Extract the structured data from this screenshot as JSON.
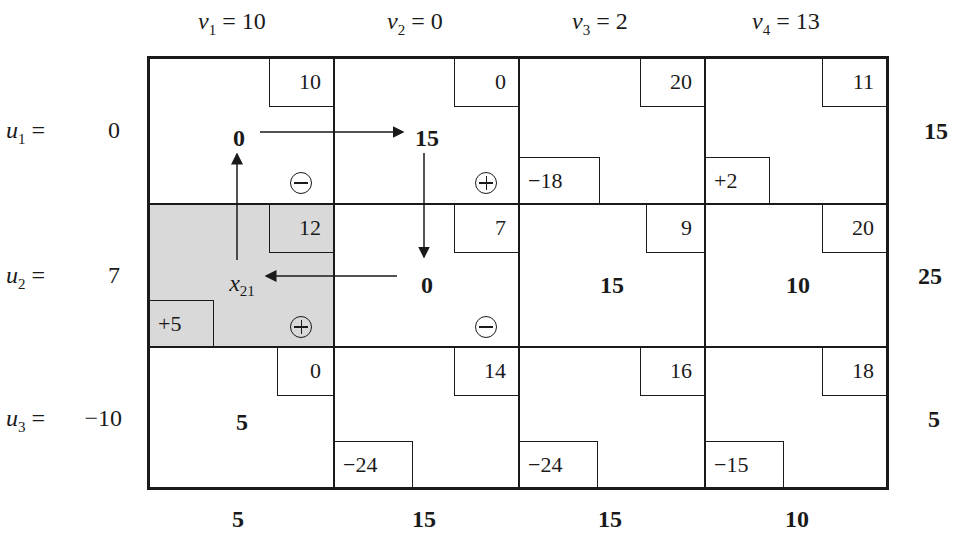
{
  "title_fragment": "TABLE 5-12",
  "column_potentials": [
    {
      "symbol": "v",
      "index": "1",
      "value": "10"
    },
    {
      "symbol": "v",
      "index": "2",
      "value": "0"
    },
    {
      "symbol": "v",
      "index": "3",
      "value": "2"
    },
    {
      "symbol": "v",
      "index": "4",
      "value": "13"
    }
  ],
  "row_potentials": [
    {
      "symbol": "u",
      "index": "1",
      "value": "0"
    },
    {
      "symbol": "u",
      "index": "2",
      "value": "7"
    },
    {
      "symbol": "u",
      "index": "3",
      "value": "−10"
    }
  ],
  "cells": [
    [
      {
        "cost": "10",
        "allocation": "0",
        "reduced": "",
        "sign": "minus"
      },
      {
        "cost": "0",
        "allocation": "15",
        "reduced": "",
        "sign": "plus"
      },
      {
        "cost": "20",
        "allocation": "",
        "reduced": "−18",
        "sign": ""
      },
      {
        "cost": "11",
        "allocation": "",
        "reduced": "+2",
        "sign": ""
      }
    ],
    [
      {
        "cost": "12",
        "allocation": "x",
        "allocation_sub": "21",
        "reduced": "+5",
        "sign": "plus",
        "shaded": true
      },
      {
        "cost": "7",
        "allocation": "0",
        "reduced": "",
        "sign": "minus"
      },
      {
        "cost": "9",
        "allocation": "15",
        "reduced": "",
        "sign": ""
      },
      {
        "cost": "20",
        "allocation": "10",
        "reduced": "",
        "sign": ""
      }
    ],
    [
      {
        "cost": "0",
        "allocation": "5",
        "reduced": "",
        "sign": ""
      },
      {
        "cost": "14",
        "allocation": "",
        "reduced": "−24",
        "sign": ""
      },
      {
        "cost": "16",
        "allocation": "",
        "reduced": "−24",
        "sign": ""
      },
      {
        "cost": "18",
        "allocation": "",
        "reduced": "−15",
        "sign": ""
      }
    ]
  ],
  "supply": [
    "15",
    "25",
    "5"
  ],
  "demand": [
    "5",
    "15",
    "15",
    "10"
  ],
  "loop": {
    "description": "Entering variable x21 loop: x21 → (1,1) → (1,2) → (2,2) → x21",
    "path": [
      [
        2,
        1
      ],
      [
        1,
        1
      ],
      [
        1,
        2
      ],
      [
        2,
        2
      ],
      [
        2,
        1
      ]
    ]
  },
  "colors": {
    "line": "#1a1a1a",
    "shaded_cell": "#d9d9d9",
    "background": "#ffffff"
  }
}
